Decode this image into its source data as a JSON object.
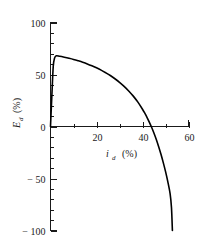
{
  "chart_data": {
    "type": "line",
    "title": "",
    "xlabel": "i_d (%)",
    "ylabel": "E_d (%)",
    "xlabel_main": "i",
    "xlabel_sub": "d",
    "xlabel_unit": "(%)",
    "ylabel_main": "E",
    "ylabel_sub": "d",
    "ylabel_unit": "(%)",
    "xlim": [
      0,
      60
    ],
    "ylim": [
      -100,
      100
    ],
    "x_major_ticks": [
      20,
      40,
      60
    ],
    "x_major_tick_labels": [
      "20",
      "40",
      "60"
    ],
    "x_minor_ticks": [
      10,
      30,
      50
    ],
    "y_major_ticks": [
      100,
      50,
      0,
      -50,
      -100
    ],
    "y_major_tick_labels": [
      "100",
      "50",
      "0",
      "− 50",
      "− 100"
    ],
    "y_minor_ticks": [
      90,
      80,
      70,
      60,
      40,
      30,
      20,
      10,
      -10,
      -20,
      -30,
      -40,
      -60,
      -70,
      -80,
      -90
    ],
    "grid": false,
    "legend": null,
    "series": [
      {
        "name": "Ed vs id",
        "x": [
          0.0,
          0.6,
          1.2,
          1.8,
          2.5,
          4.0,
          6.0,
          8.0,
          10.0,
          12.0,
          14.0,
          16.0,
          18.0,
          20.0,
          22.0,
          24.0,
          26.0,
          28.0,
          30.0,
          32.0,
          34.0,
          36.0,
          38.0,
          40.0,
          41.0,
          42.0,
          43.0,
          44.0,
          45.0,
          46.0,
          47.0,
          48.0,
          49.0,
          50.0,
          51.0,
          52.0,
          52.6,
          53.0
        ],
        "y": [
          0.0,
          30.0,
          58.0,
          66.0,
          68.0,
          67.5,
          66.6,
          65.6,
          64.5,
          63.2,
          61.8,
          60.2,
          58.4,
          56.4,
          54.2,
          51.7,
          49.0,
          45.9,
          42.5,
          38.6,
          34.2,
          29.2,
          23.4,
          16.6,
          12.8,
          8.6,
          4.0,
          -1.0,
          -6.5,
          -12.5,
          -19.2,
          -26.5,
          -34.5,
          -43.2,
          -53.0,
          -64.5,
          -78.0,
          -100.0
        ]
      }
    ]
  },
  "axis_caps": {
    "y_top_tick": "100",
    "x_right_tick": "60"
  }
}
